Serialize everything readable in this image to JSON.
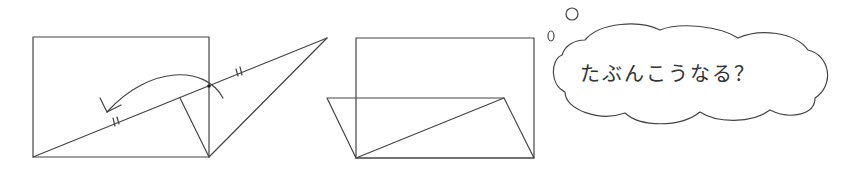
{
  "figures": {
    "before": {
      "label": "original-rectangle-with-fold",
      "rectangle": {
        "x": 33,
        "y": 37,
        "width": 176,
        "height": 120
      },
      "diagonal_extended": {
        "from": [
          33,
          157
        ],
        "to": [
          327,
          38
        ]
      },
      "triangle_flap": [
        [
          209,
          86
        ],
        [
          327,
          38
        ],
        [
          209,
          157
        ]
      ],
      "perpendicular": {
        "from": [
          180,
          98
        ],
        "to": [
          209,
          157
        ]
      },
      "intersection_point": [
        209,
        86
      ],
      "tick_marks": [
        [
          117,
          122
        ],
        [
          240,
          73
        ]
      ],
      "fold_arrow": {
        "direction": "left"
      }
    },
    "after": {
      "label": "folded-result",
      "rectangle": {
        "x": 356,
        "y": 38,
        "width": 178,
        "height": 120
      },
      "parallelogram": [
        [
          327,
          98
        ],
        [
          504,
          98
        ],
        [
          534,
          158
        ],
        [
          356,
          158
        ]
      ],
      "diagonal": {
        "from": [
          356,
          158
        ],
        "to": [
          504,
          98
        ]
      }
    }
  },
  "thought_bubble": {
    "text": "たぶんこうなる？"
  },
  "colors": {
    "stroke": "#444444",
    "background": "#ffffff",
    "text": "#333333"
  }
}
